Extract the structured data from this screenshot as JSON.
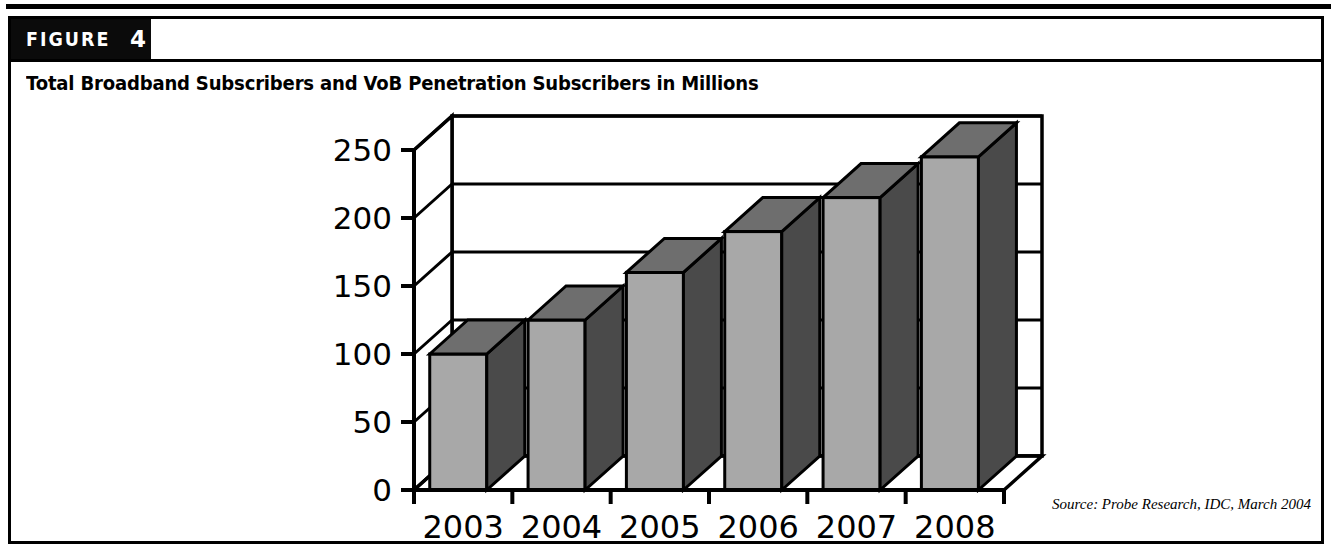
{
  "figure": {
    "badge_word": "FIGURE",
    "badge_number": "4",
    "caption": "Total Broadband Subscribers and VoB Penetration Subscribers in Millions",
    "source": "Source: Probe Research, IDC, March 2004"
  },
  "colors": {
    "ink": "#000000",
    "badge_bg": "#0b0b0b",
    "bar_front": "#a8a8a8",
    "bar_side": "#4a4a4a",
    "bar_top": "#6e6e6e",
    "page_bg": "#ffffff"
  },
  "chart_data": {
    "type": "bar",
    "title": "Total Broadband Subscribers and VoB Penetration Subscribers in Millions",
    "xlabel": "",
    "ylabel": "",
    "categories": [
      "2003",
      "2004",
      "2005",
      "2006",
      "2007",
      "2008"
    ],
    "values": [
      100,
      125,
      160,
      190,
      215,
      245
    ],
    "ylim": [
      0,
      250
    ],
    "yticks": [
      0,
      50,
      100,
      150,
      200,
      250
    ],
    "ytick_labels": [
      "0",
      "50",
      "100",
      "150",
      "200",
      "250"
    ],
    "grid": true,
    "legend": false,
    "three_d": true,
    "series": [
      {
        "name": "Total Broadband Subscribers",
        "values": [
          100,
          125,
          160,
          190,
          215,
          245
        ]
      }
    ]
  }
}
